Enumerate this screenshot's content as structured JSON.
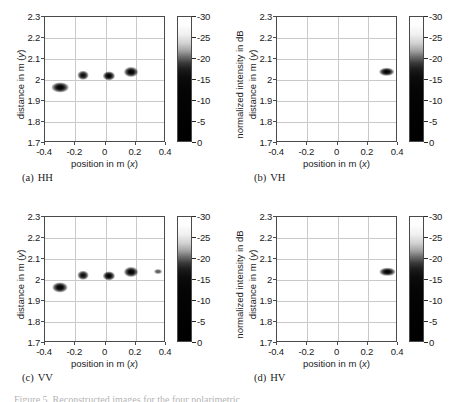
{
  "figure": {
    "caption_partial": "Figure 5. Reconstructed images for the four polarimetric",
    "axes": {
      "xlabel_text": "position in m (",
      "xlabel_sym": "x",
      "xlabel_close": ")",
      "ylabel_text": "distance in m (",
      "ylabel_sym": "y",
      "ylabel_close": ")",
      "xticks": [
        "-0.4",
        "-0.2",
        "0",
        "0.2",
        "0.4"
      ],
      "xtick_values": [
        -0.4,
        -0.2,
        0,
        0.2,
        0.4
      ],
      "yticks": [
        "1.7",
        "1.8",
        "1.9",
        "2",
        "2.1",
        "2.2",
        "2.3"
      ],
      "ytick_values": [
        1.7,
        1.8,
        1.9,
        2.0,
        2.1,
        2.2,
        2.3
      ],
      "xlim": [
        -0.4,
        0.4
      ],
      "ylim": [
        1.7,
        2.3
      ]
    },
    "colorbar": {
      "title": "normalized intensity in dB",
      "ticks": [
        "-30",
        "-25",
        "-20",
        "-15",
        "-10",
        "-5",
        "0"
      ],
      "tick_values": [
        -30,
        -25,
        -20,
        -15,
        -10,
        -5,
        0
      ],
      "vmin": -30,
      "vmax": 0,
      "colormap": "gray-reversed",
      "low_color": "#000000",
      "high_color": "#ffffff"
    },
    "panels": [
      {
        "tag": "(a)",
        "label": "HH"
      },
      {
        "tag": "(b)",
        "label": "VH"
      },
      {
        "tag": "(c)",
        "label": "VV"
      },
      {
        "tag": "(d)",
        "label": "HV"
      }
    ]
  },
  "chart_data": {
    "type": "heatmap",
    "title": "",
    "xlabel": "position in m (x)",
    "ylabel": "distance in m (y)",
    "xlim": [
      -0.4,
      0.4
    ],
    "ylim": [
      1.7,
      2.3
    ],
    "zlabel": "normalized intensity in dB",
    "zlim": [
      -30,
      0
    ],
    "grid": true,
    "colormap": "gray-reversed",
    "panels": [
      {
        "tag": "(a)",
        "label": "HH",
        "points": [
          {
            "x": -0.3,
            "y": 1.965,
            "intensity": 0,
            "rx": 0.055,
            "ry": 0.022
          },
          {
            "x": -0.15,
            "y": 2.022,
            "intensity": -2,
            "rx": 0.036,
            "ry": 0.02
          },
          {
            "x": 0.02,
            "y": 2.018,
            "intensity": 0,
            "rx": 0.04,
            "ry": 0.022
          },
          {
            "x": 0.17,
            "y": 2.038,
            "intensity": 0,
            "rx": 0.046,
            "ry": 0.024
          }
        ]
      },
      {
        "tag": "(b)",
        "label": "VH",
        "points": [
          {
            "x": 0.325,
            "y": 2.04,
            "intensity": 0,
            "rx": 0.052,
            "ry": 0.02
          }
        ]
      },
      {
        "tag": "(c)",
        "label": "VV",
        "points": [
          {
            "x": -0.3,
            "y": 1.965,
            "intensity": 0,
            "rx": 0.05,
            "ry": 0.022
          },
          {
            "x": -0.15,
            "y": 2.022,
            "intensity": -2,
            "rx": 0.036,
            "ry": 0.02
          },
          {
            "x": 0.02,
            "y": 2.018,
            "intensity": 0,
            "rx": 0.04,
            "ry": 0.022
          },
          {
            "x": 0.17,
            "y": 2.04,
            "intensity": 0,
            "rx": 0.046,
            "ry": 0.024
          },
          {
            "x": 0.35,
            "y": 2.04,
            "intensity": -12,
            "rx": 0.026,
            "ry": 0.014
          }
        ]
      },
      {
        "tag": "(d)",
        "label": "HV",
        "points": [
          {
            "x": 0.33,
            "y": 2.04,
            "intensity": 0,
            "rx": 0.05,
            "ry": 0.02
          }
        ]
      }
    ]
  }
}
